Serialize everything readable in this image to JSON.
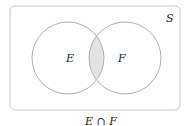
{
  "diagram": {
    "type": "venn",
    "universe_label": "S",
    "sets": [
      {
        "label": "E"
      },
      {
        "label": "F"
      }
    ],
    "shaded_region": "intersection",
    "caption": "E ∩ F",
    "colors": {
      "stroke": "#b0b0b0",
      "shade": "#e3e3e3",
      "text": "#222222"
    }
  }
}
